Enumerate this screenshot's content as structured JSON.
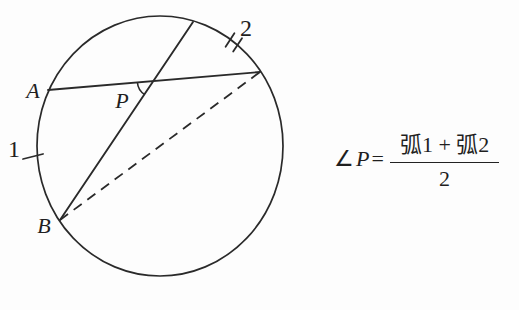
{
  "colors": {
    "background": "#fdfdfd",
    "ink": "#2a2a2a"
  },
  "diagram": {
    "labels": {
      "point_a": "A",
      "point_b": "B",
      "vertex_p": "P",
      "arc_1": "1",
      "arc_2": "2"
    }
  },
  "formula": {
    "angle_symbol": "∠",
    "variable": "P",
    "equals": "=",
    "numerator": "弧1 + 弧2",
    "denominator": "2"
  }
}
